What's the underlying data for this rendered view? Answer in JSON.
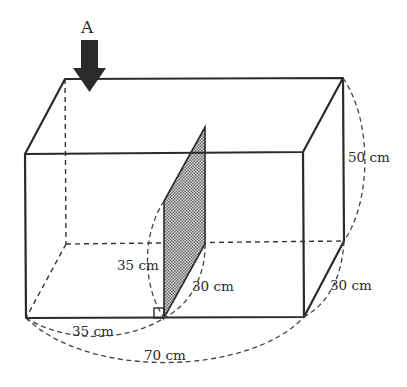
{
  "figure": {
    "type": "rectangular-prism-with-hinged-partition",
    "view_arrow": {
      "label": "A",
      "direction": "down",
      "color": "#2a2a2a"
    },
    "dimensions": {
      "height": "50 cm",
      "depth": "30 cm",
      "length": "70 cm",
      "partition_base_offset": "35 cm",
      "partition_height": "35 cm",
      "partition_width": "30 cm"
    },
    "partition": {
      "fill_pattern": "dotted",
      "fill_color": "#9a9a9a"
    },
    "right_angle_marker": true
  }
}
